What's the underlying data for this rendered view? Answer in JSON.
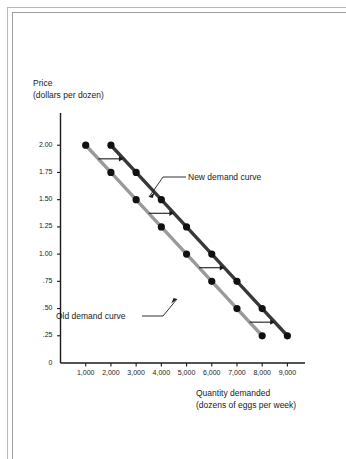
{
  "figure": {
    "background_color": "#ffffff",
    "frame_color": "#b9b9b9"
  },
  "chart_data": {
    "type": "line",
    "title": "",
    "xlabel": "Quantity demanded\n(dozens of eggs per week)",
    "xlabel_line1": "Quantity demanded",
    "xlabel_line2": "(dozens of eggs per week)",
    "ylabel": "Price\n(dollars per dozen)",
    "ylabel_line1": "Price",
    "ylabel_line2": "(dollars per dozen)",
    "xlim": [
      0,
      9500
    ],
    "ylim": [
      0,
      2.25
    ],
    "grid": false,
    "legend_position": "inline-annotation",
    "x_tick_values": [
      1000,
      2000,
      3000,
      4000,
      5000,
      6000,
      7000,
      8000,
      9000
    ],
    "x_tick_labels": [
      "1,000",
      "2,000",
      "3,000",
      "4,000",
      "5,000",
      "6,000",
      "7,000",
      "8,000",
      "9,000"
    ],
    "y_tick_values": [
      2.0,
      1.75,
      1.5,
      1.25,
      1.0,
      0.75,
      0.5,
      0.25,
      0
    ],
    "y_tick_labels": [
      "2.00",
      "1.75",
      "1.50",
      "1.25",
      "1.00",
      ".75",
      ".50",
      ".25",
      "0"
    ],
    "series": [
      {
        "name": "Old demand curve",
        "color": "#9a9a9a",
        "marker_color": "#111111",
        "x": [
          1000,
          2000,
          3000,
          4000,
          5000,
          6000,
          7000,
          8000
        ],
        "values": [
          2.0,
          1.75,
          1.5,
          1.25,
          1.0,
          0.75,
          0.5,
          0.25
        ]
      },
      {
        "name": "New demand curve",
        "color": "#383838",
        "marker_color": "#111111",
        "x": [
          2000,
          3000,
          4000,
          5000,
          6000,
          7000,
          8000,
          9000
        ],
        "values": [
          2.0,
          1.75,
          1.5,
          1.25,
          1.0,
          0.75,
          0.5,
          0.25
        ]
      }
    ],
    "annotations": [
      {
        "name": "new-demand-curve-label",
        "text": "New demand curve",
        "points_to_series": "New demand curve"
      },
      {
        "name": "old-demand-curve-label",
        "text": "Old demand curve",
        "points_to_series": "Old demand curve"
      }
    ],
    "shift_arrows": [
      {
        "name": "shift-arrow-upper",
        "price": 1.875,
        "from_quantity": 1500,
        "to_quantity": 2500
      },
      {
        "name": "shift-arrow-middle",
        "price": 1.375,
        "from_quantity": 3500,
        "to_quantity": 4500
      },
      {
        "name": "shift-arrow-lower",
        "price": 0.875,
        "from_quantity": 5500,
        "to_quantity": 6500
      },
      {
        "name": "shift-arrow-bottom",
        "price": 0.375,
        "from_quantity": 7500,
        "to_quantity": 8500
      }
    ]
  }
}
